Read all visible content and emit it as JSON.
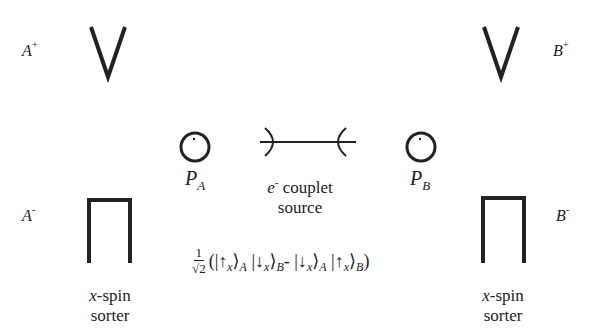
{
  "diagram": {
    "left_detector": {
      "plus_label": {
        "base": "A",
        "sup": "+"
      },
      "minus_label": {
        "base": "A",
        "sup": "-"
      },
      "caption_italic": "x",
      "caption_rest": "-spin",
      "caption_line2": "sorter"
    },
    "right_detector": {
      "plus_label": {
        "base": "B",
        "sup": "+"
      },
      "minus_label": {
        "base": "B",
        "sup": "-"
      },
      "caption_italic": "x",
      "caption_rest": "-spin",
      "caption_line2": "sorter"
    },
    "polarizer_a": {
      "base": "P",
      "sub": "A"
    },
    "polarizer_b": {
      "base": "P",
      "sub": "B"
    },
    "source": {
      "symbol": "e",
      "sup": "-",
      "line1_rest": " couplet",
      "line2": "source"
    },
    "state": {
      "frac_num": "1",
      "frac_den": "√2",
      "open": "(",
      "term1_ket1": "|↑",
      "term1_ket1_sub": "x",
      "term1_ket1_close": "⟩",
      "term1_ket1_label": "A",
      "term1_ket2": " |↓",
      "term1_ket2_sub": "x",
      "term1_ket2_close": "⟩",
      "term1_ket2_label": "B",
      "minus": "- ",
      "term2_ket1": "|↓",
      "term2_ket1_sub": "x",
      "term2_ket1_close": "⟩",
      "term2_ket1_label": "A",
      "term2_ket2": " |↑",
      "term2_ket2_sub": "x",
      "term2_ket2_close": "⟩",
      "term2_ket2_label": "B",
      "close": ")"
    }
  }
}
